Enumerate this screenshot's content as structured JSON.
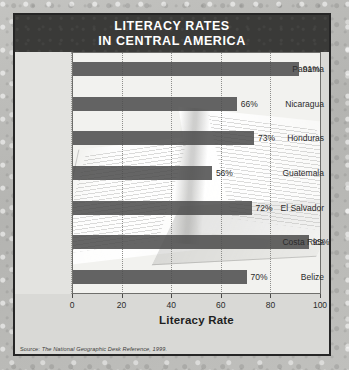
{
  "title": {
    "line1": "LITERACY RATES",
    "line2": "IN CENTRAL AMERICA"
  },
  "source": {
    "prefix": "Source:",
    "text": "The National Geographic Desk Reference, 1999."
  },
  "colors": {
    "banner": "#3a3a38",
    "bar": "#4c4c4c",
    "frame": "#262626",
    "plot_background": "#f2f2ef",
    "label_gutter": "#e3e3e0",
    "page_margin": "#b9b9b7",
    "text": "#2b2b2b"
  },
  "chart_data": {
    "type": "bar",
    "orientation": "horizontal",
    "title": "LITERACY RATES IN CENTRAL AMERICA",
    "xlabel": "Literacy Rate",
    "ylabel": "",
    "xlim": [
      0,
      100
    ],
    "xticks": [
      "0",
      "20",
      "40",
      "60",
      "80",
      "100"
    ],
    "grid": true,
    "legend": null,
    "categories": [
      "Panama",
      "Nicaragua",
      "Honduras",
      "Guatemala",
      "El Salvador",
      "Costa Rica",
      "Belize"
    ],
    "values": [
      91,
      66,
      73,
      56,
      72,
      95,
      70
    ],
    "value_labels": [
      "91%",
      "66%",
      "73%",
      "56%",
      "72%",
      "95%",
      "70%"
    ]
  }
}
